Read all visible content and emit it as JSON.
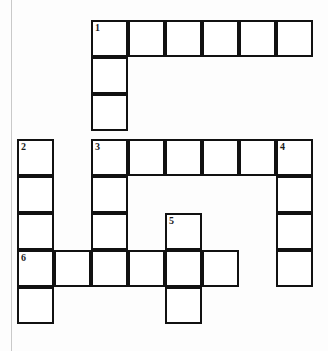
{
  "puzzle": {
    "type": "crossword-grid",
    "title": "",
    "rows": 8,
    "cols": 8,
    "cell_size": 37,
    "origin_x": 17,
    "origin_y": 20,
    "row_offsets": [
      20,
      57,
      94,
      139,
      176,
      213,
      250,
      287
    ],
    "border_color": "#111111",
    "cell_fill": "#ffffff",
    "page_background": "#fdfdfd",
    "margin_rule_color": "#c9c9c9",
    "cells": [
      {
        "row": 0,
        "col": 2,
        "number": "1",
        "letter": ""
      },
      {
        "row": 0,
        "col": 3,
        "number": "",
        "letter": ""
      },
      {
        "row": 0,
        "col": 4,
        "number": "",
        "letter": ""
      },
      {
        "row": 0,
        "col": 5,
        "number": "",
        "letter": ""
      },
      {
        "row": 0,
        "col": 6,
        "number": "",
        "letter": ""
      },
      {
        "row": 0,
        "col": 7,
        "number": "",
        "letter": ""
      },
      {
        "row": 1,
        "col": 2,
        "number": "",
        "letter": ""
      },
      {
        "row": 2,
        "col": 2,
        "number": "",
        "letter": ""
      },
      {
        "row": 3,
        "col": 0,
        "number": "2",
        "letter": ""
      },
      {
        "row": 3,
        "col": 2,
        "number": "3",
        "letter": ""
      },
      {
        "row": 3,
        "col": 3,
        "number": "",
        "letter": ""
      },
      {
        "row": 3,
        "col": 4,
        "number": "",
        "letter": ""
      },
      {
        "row": 3,
        "col": 5,
        "number": "",
        "letter": ""
      },
      {
        "row": 3,
        "col": 6,
        "number": "",
        "letter": ""
      },
      {
        "row": 3,
        "col": 7,
        "number": "4",
        "letter": ""
      },
      {
        "row": 4,
        "col": 0,
        "number": "",
        "letter": ""
      },
      {
        "row": 4,
        "col": 2,
        "number": "",
        "letter": ""
      },
      {
        "row": 4,
        "col": 7,
        "number": "",
        "letter": ""
      },
      {
        "row": 5,
        "col": 0,
        "number": "",
        "letter": ""
      },
      {
        "row": 5,
        "col": 2,
        "number": "",
        "letter": ""
      },
      {
        "row": 5,
        "col": 4,
        "number": "5",
        "letter": ""
      },
      {
        "row": 5,
        "col": 7,
        "number": "",
        "letter": ""
      },
      {
        "row": 6,
        "col": 0,
        "number": "6",
        "letter": ""
      },
      {
        "row": 6,
        "col": 1,
        "number": "",
        "letter": ""
      },
      {
        "row": 6,
        "col": 2,
        "number": "",
        "letter": ""
      },
      {
        "row": 6,
        "col": 3,
        "number": "",
        "letter": ""
      },
      {
        "row": 6,
        "col": 4,
        "number": "",
        "letter": ""
      },
      {
        "row": 6,
        "col": 5,
        "number": "",
        "letter": ""
      },
      {
        "row": 6,
        "col": 7,
        "number": "",
        "letter": ""
      },
      {
        "row": 7,
        "col": 0,
        "number": "",
        "letter": ""
      },
      {
        "row": 7,
        "col": 4,
        "number": "",
        "letter": ""
      }
    ],
    "entries": {
      "across": [
        {
          "number": "1",
          "row": 0,
          "col": 2,
          "length": 6
        },
        {
          "number": "3",
          "row": 3,
          "col": 2,
          "length": 6
        },
        {
          "number": "6",
          "row": 6,
          "col": 0,
          "length": 6
        }
      ],
      "down": [
        {
          "number": "1",
          "row": 0,
          "col": 2,
          "length": 7
        },
        {
          "number": "2",
          "row": 3,
          "col": 0,
          "length": 5
        },
        {
          "number": "4",
          "row": 3,
          "col": 7,
          "length": 4
        },
        {
          "number": "5",
          "row": 5,
          "col": 4,
          "length": 3
        }
      ]
    }
  }
}
